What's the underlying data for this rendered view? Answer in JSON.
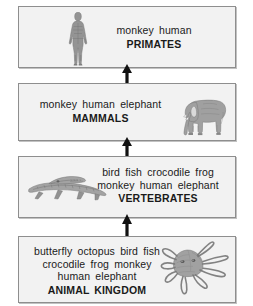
{
  "diagram": {
    "colors": {
      "box_fill": "#f2f2f2",
      "box_border": "#8e8e8e",
      "text": "#1a1a1a",
      "arrow": "#111111",
      "page_background": "#ffffff"
    },
    "levels": [
      {
        "id": "primates",
        "members": "monkey human",
        "group": "PRIMATES",
        "illustration": "human-figure-illustration"
      },
      {
        "id": "mammals",
        "members": "monkey human elephant",
        "group": "MAMMALS",
        "illustration": "elephant-illustration"
      },
      {
        "id": "vertebrates",
        "members": "bird fish crocodile frog\nmonkey human elephant",
        "members_line1": "bird fish crocodile frog",
        "members_line2": "monkey human elephant",
        "group": "VERTEBRATES",
        "illustration": "crocodile-illustration"
      },
      {
        "id": "animalkingdom",
        "members": "butterfly octopus bird fish\ncrocodile frog monkey\nhuman elephant",
        "members_line1": "butterfly octopus bird fish",
        "members_line2": "crocodile frog monkey",
        "members_line3": "human elephant",
        "group": "ANIMAL KINGDOM",
        "illustration": "octopus-illustration"
      }
    ],
    "arrows": [
      {
        "id": "arrow-vertebrates-to-mammals",
        "direction": "up"
      },
      {
        "id": "arrow-animalkingdom-to-vertebrates",
        "direction": "up"
      },
      {
        "id": "arrow-mammals-to-primates",
        "direction": "up"
      }
    ]
  }
}
